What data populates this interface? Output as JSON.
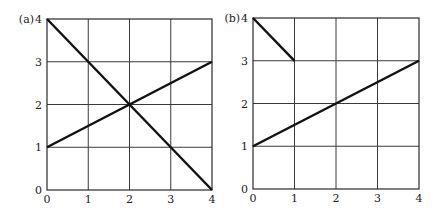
{
  "chart_data": [
    {
      "type": "line",
      "panel_label": "(a)",
      "title": "",
      "xlabel": "",
      "ylabel": "",
      "xlim": [
        0,
        4
      ],
      "ylim": [
        0,
        4
      ],
      "x_ticks": [
        "0",
        "1",
        "2",
        "3",
        "4"
      ],
      "y_ticks": [
        "0",
        "1",
        "2",
        "3",
        "4"
      ],
      "grid": true,
      "legend": null,
      "series": [
        {
          "name": "decreasing line",
          "x": [
            0,
            4
          ],
          "y": [
            4,
            0
          ]
        },
        {
          "name": "increasing line",
          "x": [
            0,
            4
          ],
          "y": [
            1,
            3
          ]
        }
      ],
      "frame": {
        "left": 47,
        "right": 212,
        "top": 19,
        "bottom": 190
      }
    },
    {
      "type": "line",
      "panel_label": "(b)",
      "title": "",
      "xlabel": "",
      "ylabel": "",
      "xlim": [
        0,
        4
      ],
      "ylim": [
        0,
        4
      ],
      "x_ticks": [
        "0",
        "1",
        "2",
        "3",
        "4"
      ],
      "y_ticks": [
        "0",
        "1",
        "2",
        "3",
        "4"
      ],
      "grid": true,
      "legend": null,
      "series": [
        {
          "name": "short decreasing segment",
          "x": [
            0,
            1
          ],
          "y": [
            4,
            3
          ]
        },
        {
          "name": "increasing line",
          "x": [
            0,
            4
          ],
          "y": [
            1,
            3
          ]
        }
      ],
      "frame": {
        "left": 253,
        "right": 419,
        "top": 18,
        "bottom": 189
      }
    }
  ],
  "colors": {
    "line": "#111111",
    "grid": "#3a3a3a",
    "background": "#ffffff"
  }
}
